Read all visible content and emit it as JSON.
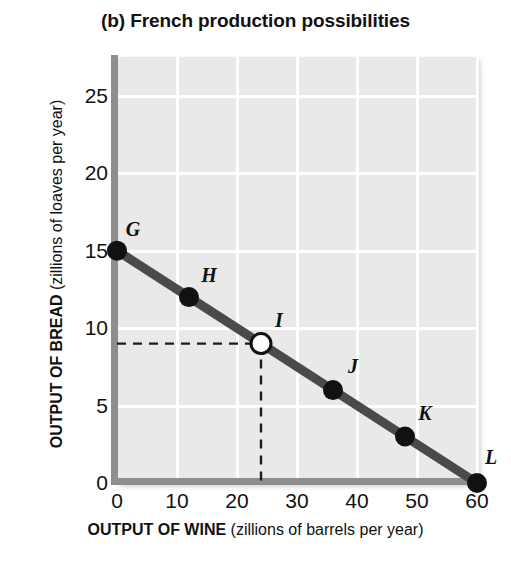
{
  "chart_data": {
    "type": "line",
    "title": "(b) French production possibilities",
    "xlabel_bold": "OUTPUT OF WINE",
    "xlabel_rest": " (zillions of barrels per year)",
    "ylabel_bold": "OUTPUT OF BREAD",
    "ylabel_rest": " (zillions of loaves per year)",
    "xlim": [
      0,
      60
    ],
    "ylim": [
      0,
      27.5
    ],
    "xticks": [
      0,
      10,
      20,
      30,
      40,
      50,
      60
    ],
    "yticks": [
      0,
      5,
      10,
      15,
      20,
      25
    ],
    "grid": true,
    "legend": "none",
    "series": [
      {
        "name": "French production possibilities frontier",
        "x": [
          0,
          12,
          24,
          36,
          48,
          60
        ],
        "y": [
          15,
          12,
          9,
          6,
          3,
          0
        ],
        "point_labels": [
          "G",
          "H",
          "I",
          "J",
          "K",
          "L"
        ],
        "point_styles": [
          "filled",
          "filled",
          "open",
          "filled",
          "filled",
          "filled"
        ],
        "line_color": "#4a4a4a"
      }
    ],
    "annotations": [
      {
        "name": "guide-lines-at-I",
        "type": "dashed-guides",
        "x": 24,
        "y": 9,
        "style": "dashed"
      }
    ],
    "colors": {
      "plot_background": "#e9e9e9",
      "gridline": "#ffffff",
      "axis": "#8e8e8e",
      "line": "#4a4a4a",
      "marker_fill": "#111111",
      "marker_open_fill": "#ffffff",
      "text": "#111111"
    }
  },
  "point_label_offsets": [
    {
      "label": "G",
      "dx": 16,
      "dy": -22
    },
    {
      "label": "H",
      "dx": 20,
      "dy": -22
    },
    {
      "label": "I",
      "dx": 18,
      "dy": -24
    },
    {
      "label": "J",
      "dx": 20,
      "dy": -24
    },
    {
      "label": "K",
      "dx": 20,
      "dy": -24
    },
    {
      "label": "L",
      "dx": 14,
      "dy": -26
    }
  ]
}
